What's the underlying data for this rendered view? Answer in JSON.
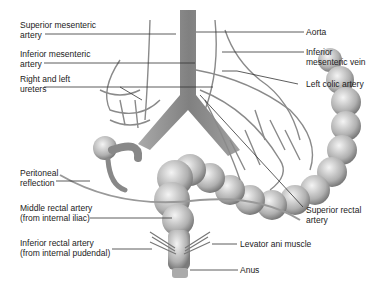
{
  "figure": {
    "labels_left": [
      {
        "id": "sma",
        "lines": [
          "Superior mesenteric",
          "artery"
        ]
      },
      {
        "id": "ima",
        "lines": [
          "Inferior mesenteric",
          "artery"
        ]
      },
      {
        "id": "ureters",
        "lines": [
          "Right and left",
          "ureters"
        ]
      },
      {
        "id": "peritoneal",
        "lines": [
          "Peritoneal",
          "reflection"
        ]
      },
      {
        "id": "mra",
        "lines": [
          "Middle rectal artery",
          "(from internal iliac)"
        ]
      },
      {
        "id": "ira",
        "lines": [
          "Inferior rectal artery",
          "(from internal pudendal)"
        ]
      }
    ],
    "labels_right": [
      {
        "id": "aorta",
        "lines": [
          "Aorta"
        ]
      },
      {
        "id": "imv",
        "lines": [
          "Inferior",
          "mesenteric vein"
        ]
      },
      {
        "id": "lca",
        "lines": [
          "Left colic artery"
        ]
      },
      {
        "id": "sra",
        "lines": [
          "Superior rectal",
          "artery"
        ]
      },
      {
        "id": "levator",
        "lines": [
          "Levator ani muscle"
        ]
      },
      {
        "id": "anus",
        "lines": [
          "Anus"
        ]
      }
    ],
    "colors": {
      "line": "#333333",
      "tissue_light": "#e8e8e8",
      "tissue_dark": "#8a8a8a",
      "vessel": "#9a9a9a"
    }
  }
}
